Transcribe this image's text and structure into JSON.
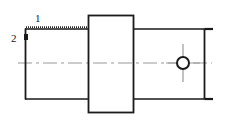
{
  "drawing": {
    "title": "Stepped shaft cross-section",
    "view_type": "sectional elevation",
    "background_color": "#ffffff",
    "line_color": "#1a1a1a",
    "centerline_color": "#9a9a9a",
    "callouts": [
      {
        "id": "1",
        "label": "1",
        "target": "top surface of left cylindrical section"
      },
      {
        "id": "2",
        "label": "2",
        "target": "left end face edge"
      }
    ],
    "features": {
      "left_section": {
        "name": "left-cylinder",
        "x": 25,
        "y": 29,
        "width": 63,
        "height": 70,
        "top_surface_marked": true
      },
      "center_flange": {
        "name": "center-flange-block",
        "x": 88,
        "y": 15,
        "width": 46,
        "height": 98
      },
      "right_section": {
        "name": "right-cylinder",
        "x": 134,
        "y": 29,
        "width": 71,
        "height": 70
      },
      "bore_hole": {
        "name": "through-hole",
        "cx": 183,
        "cy": 63,
        "r": 6.5,
        "crosshair": true
      },
      "centerline": {
        "name": "axis-centerline",
        "y": 63,
        "x_start": 18,
        "x_end": 212,
        "style": "dash-dot"
      },
      "edge_ticks": [
        {
          "name": "tick-top-right",
          "x": 205,
          "y": 29,
          "length": 8
        },
        {
          "name": "tick-bottom-right",
          "x": 205,
          "y": 99,
          "length": 8
        }
      ]
    }
  }
}
